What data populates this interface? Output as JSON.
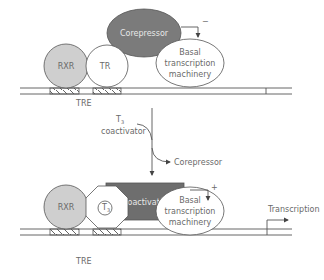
{
  "diagram": {
    "colors": {
      "rxr_fill": "#cfcfcf",
      "corepressor_fill": "#7b7b7b",
      "coactivator_fill": "#6e6e6e",
      "line": "#555555",
      "text": "#6a6a6a"
    },
    "top_panel": {
      "rxr_label": "RXR",
      "tr_label": "TR",
      "corepressor_label": "Corepressor",
      "basal_line1": "Basal",
      "basal_line2": "transcription",
      "basal_line3": "machinery",
      "effect_sign": "−",
      "tre_label": "TRE"
    },
    "transition": {
      "input_line1": "T",
      "input_sub": "3",
      "input_line2": "coactivator",
      "output_label": "Corepressor"
    },
    "bottom_panel": {
      "rxr_label": "RXR",
      "t3_label": "T",
      "t3_sub": "3",
      "coactivator_label": "Coactivator",
      "basal_line1": "Basal",
      "basal_line2": "transcription",
      "basal_line3": "machinery",
      "effect_sign": "+",
      "tre_label": "TRE",
      "transcription_label": "Transcription"
    }
  }
}
